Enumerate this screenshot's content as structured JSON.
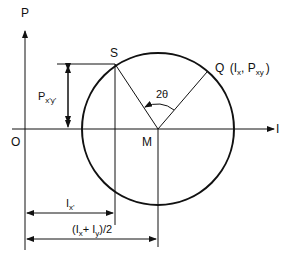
{
  "diagram": {
    "axes": {
      "vertical_label": "P",
      "horizontal_label": "I",
      "origin_label": "O"
    },
    "points": {
      "center": "M",
      "s_point": "S",
      "q_point_name": "Q",
      "q_point_coords": "(I",
      "q_sub_x": "x",
      "q_comma": ", P",
      "q_sub_xy": "xy",
      "q_close": ")"
    },
    "angle_label": "2θ",
    "dimensions": {
      "p_label": "P",
      "p_sub": "x'y'",
      "ix_label": "I",
      "ix_sub": "x'",
      "avg_open": "(I",
      "avg_sub_x": "x",
      "avg_plus": "+ I",
      "avg_sub_y": "y",
      "avg_close": ")/2"
    },
    "colors": {
      "stroke": "#111111",
      "background": "#ffffff"
    }
  }
}
